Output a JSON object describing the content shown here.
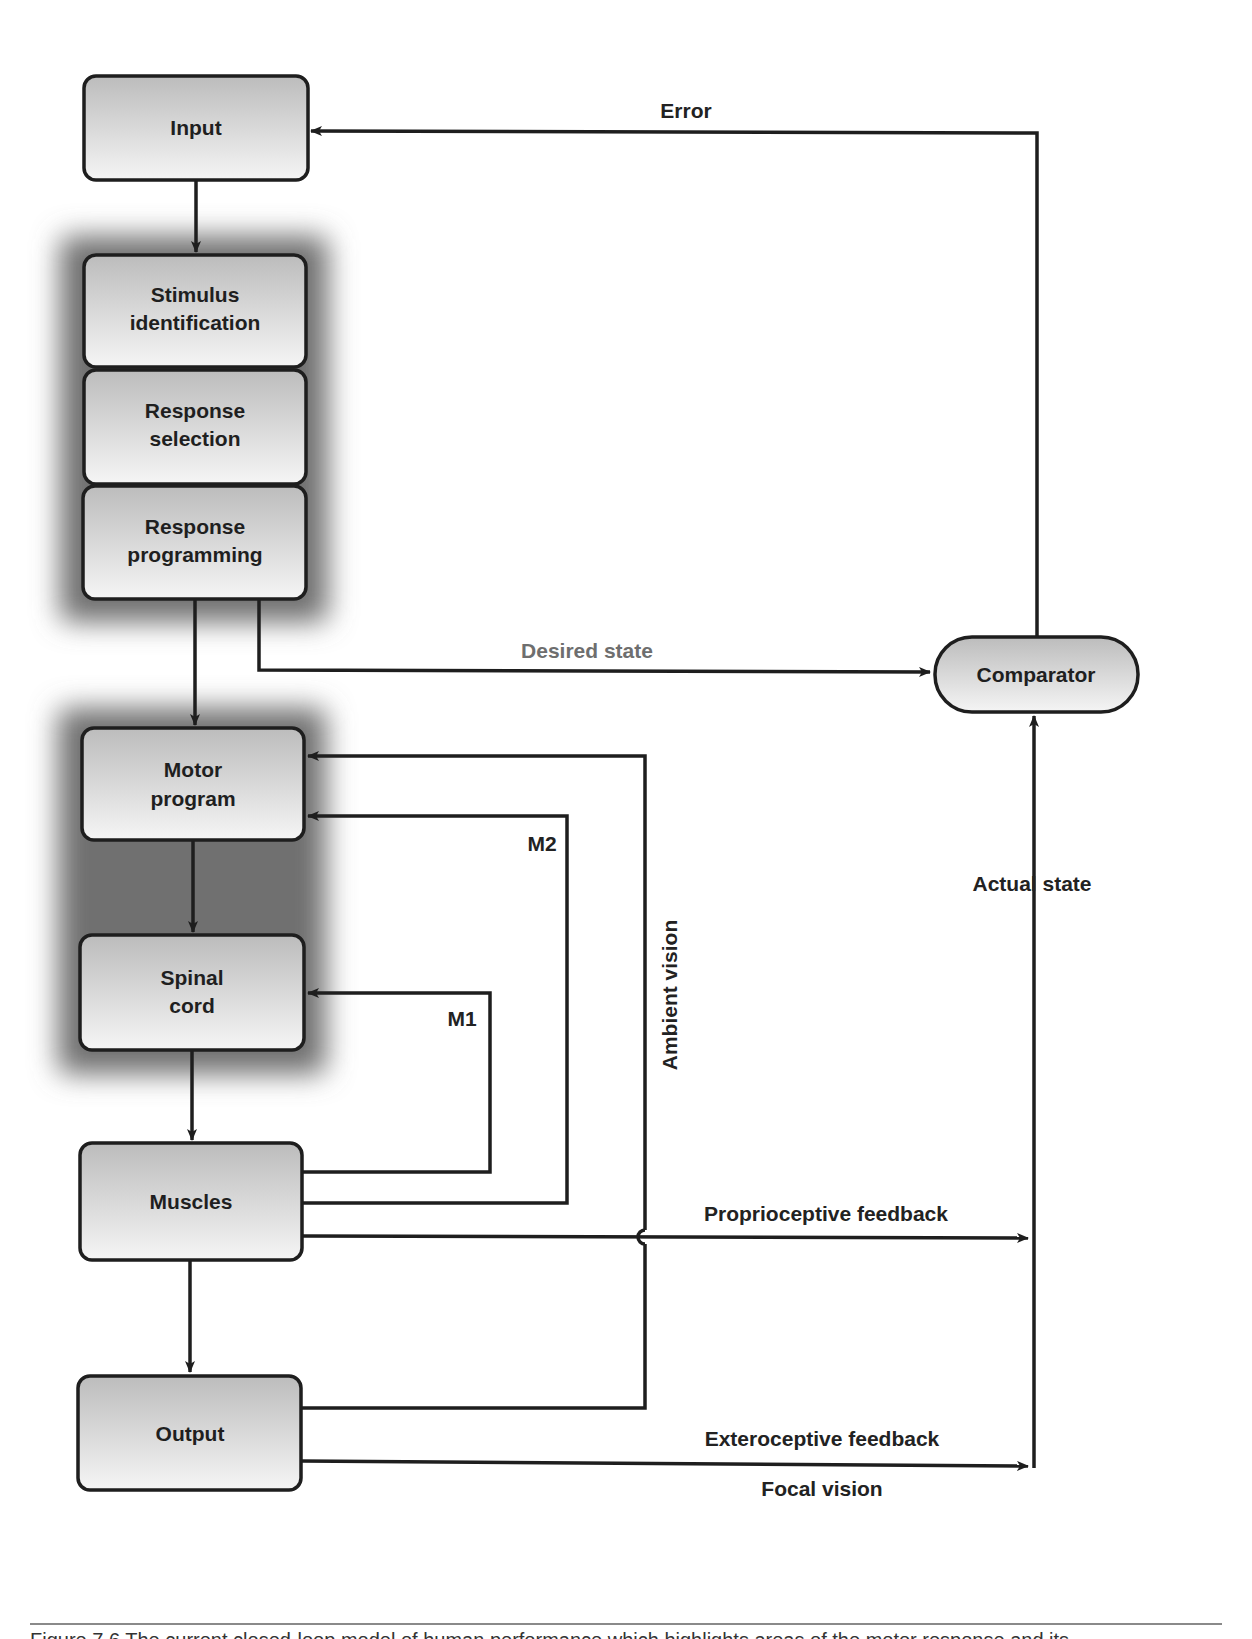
{
  "diagram": {
    "nodes": {
      "input": {
        "label": "Input"
      },
      "stimulus_identification": {
        "line1": "Stimulus",
        "line2": "identification"
      },
      "response_selection": {
        "line1": "Response",
        "line2": "selection"
      },
      "response_programming": {
        "line1": "Response",
        "line2": "programming"
      },
      "motor_program": {
        "line1": "Motor",
        "line2": "program"
      },
      "spinal_cord": {
        "line1": "Spinal",
        "line2": "cord"
      },
      "muscles": {
        "label": "Muscles"
      },
      "output": {
        "label": "Output"
      },
      "comparator": {
        "label": "Comparator"
      }
    },
    "edges": {
      "error": "Error",
      "desired_state": "Desired state",
      "actual_state": "Actual state",
      "m2": "M2",
      "m1": "M1",
      "ambient_vision": "Ambient vision",
      "proprioceptive_feedback": "Proprioceptive feedback",
      "exteroceptive_feedback": "Exteroceptive feedback",
      "focal_vision": "Focal vision"
    },
    "connections": [
      {
        "from": "Input",
        "to": "Stimulus identification"
      },
      {
        "from": "Stimulus identification",
        "to": "Response selection"
      },
      {
        "from": "Response selection",
        "to": "Response programming"
      },
      {
        "from": "Response programming",
        "to": "Motor program"
      },
      {
        "from": "Response programming",
        "to": "Comparator",
        "label": "Desired state"
      },
      {
        "from": "Motor program",
        "to": "Spinal cord"
      },
      {
        "from": "Spinal cord",
        "to": "Muscles"
      },
      {
        "from": "Muscles",
        "to": "Output"
      },
      {
        "from": "Muscles",
        "to": "Spinal cord",
        "label": "M1"
      },
      {
        "from": "Muscles",
        "to": "Motor program",
        "label": "M2"
      },
      {
        "from": "Output",
        "to": "Motor program",
        "label": "Ambient vision"
      },
      {
        "from": "Muscles",
        "to": "Comparator",
        "label": "Proprioceptive feedback"
      },
      {
        "from": "Output",
        "to": "Comparator",
        "label": "Exteroceptive feedback / Focal vision"
      },
      {
        "from": "Comparator",
        "to": "Input",
        "label": "Error"
      }
    ],
    "colors": {
      "stroke": "#1e1e1e",
      "box_fill_top": "#bdbdbd",
      "box_fill_bottom": "#f4f4f4",
      "glow": "#7a7a7a",
      "desired_state_label": "#6e6e6e"
    }
  },
  "caption": {
    "text": "Figure 7.6  The current closed-loop model of human performance which highlights areas of the motor response and its"
  }
}
